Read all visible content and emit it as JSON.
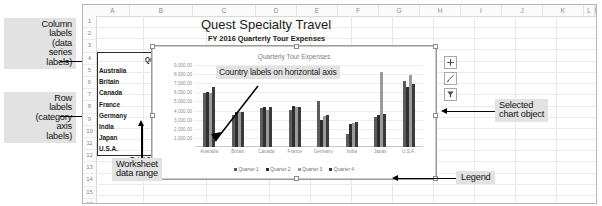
{
  "annotations": {
    "column_labels": [
      "Column",
      "labels",
      "(data",
      "series",
      "labels)"
    ],
    "row_labels": [
      "Row",
      "labels",
      "(category",
      "axis",
      "labels)"
    ],
    "worksheet_data_range": [
      "Worksheet",
      "data range"
    ],
    "selected_chart_object": [
      "Selected",
      "chart object"
    ],
    "legend_callout": "Legend",
    "country_labels": [
      "Country labels on",
      "horizontal axis"
    ]
  },
  "worksheet": {
    "column_headers": [
      "A",
      "B",
      "C",
      "D",
      "E",
      "F",
      "G",
      "H",
      "I",
      "J",
      "K",
      "L",
      "M"
    ],
    "row_headers": [
      "1",
      "2",
      "3",
      "4",
      "5",
      "6",
      "7",
      "8",
      "9",
      "10",
      "11",
      "12",
      "13",
      "14",
      "15",
      "16",
      "17",
      "18"
    ],
    "title": "Quest Specialty Travel",
    "subtitle": "FY 2016 Quarterly Tour Expenses",
    "headers": [
      "",
      "Quarter 1",
      "Quarter 2",
      "Qua"
    ],
    "rows": [
      {
        "country": "Australia",
        "q1": "5,976.20",
        "q2": "6,073.82"
      },
      {
        "country": "Britain",
        "q1": "3,510.99",
        "q2": "3,821.46"
      },
      {
        "country": "Canada",
        "q1": "4,287.76",
        "q2": "4,371.98"
      },
      {
        "country": "France",
        "q1": "4,032.10",
        "q2": "4,489.74"
      },
      {
        "country": "Germany",
        "q1": "5,082.77",
        "q2": "2,994.56"
      },
      {
        "country": "India",
        "q1": "1,468.25",
        "q2": "2,510.30"
      },
      {
        "country": "Japan",
        "q1": "3,271.50",
        "q2": "3,556.14"
      },
      {
        "country": "U.S.A.",
        "q1": "7,195.06",
        "q2": "6,542.76"
      }
    ],
    "total": {
      "label": "Total",
      "currency": "$",
      "q1": "34,824.63",
      "q2": "34,460.76",
      "q3_partial": "$"
    }
  },
  "chart_buttons": [
    {
      "name": "chart-elements-button",
      "icon": "plus-icon"
    },
    {
      "name": "chart-styles-button",
      "icon": "brush-icon"
    },
    {
      "name": "chart-filters-button",
      "icon": "funnel-icon"
    }
  ],
  "chart_data": {
    "type": "bar",
    "title": "Quarterly Tour Expenses",
    "xlabel": "",
    "ylabel": "",
    "ylim": [
      0,
      9000
    ],
    "grid": true,
    "legend_position": "bottom",
    "ytick_labels": [
      "9,000.00",
      "8,000.00",
      "7,000.00",
      "6,000.00",
      "5,000.00",
      "4,000.00",
      "3,000.00",
      "2,000.00",
      "1,000.00"
    ],
    "yticks": [
      9000,
      8000,
      7000,
      6000,
      5000,
      4000,
      3000,
      2000,
      1000
    ],
    "categories": [
      "Australia",
      "Britain",
      "Canada",
      "France",
      "Germany",
      "India",
      "Japan",
      "U.S.A."
    ],
    "series": [
      {
        "name": "Quarter 1",
        "color": "#5c5c5c",
        "values": [
          5976.2,
          3510.99,
          4287.76,
          4032.1,
          5082.77,
          1468.25,
          3271.5,
          7195.06
        ]
      },
      {
        "name": "Quarter 2",
        "color": "#2e2e2e",
        "values": [
          6073.82,
          3821.46,
          4371.98,
          4489.74,
          2994.56,
          2510.3,
          3556.14,
          6542.76
        ]
      },
      {
        "name": "Quarter 3",
        "color": "#9a9a9a",
        "values": [
          5980.0,
          3790.0,
          4100.0,
          4350.0,
          3400.0,
          2670.0,
          8280.0,
          7950.0
        ]
      },
      {
        "name": "Quarter 4",
        "color": "#3a3a3a",
        "values": [
          6620.0,
          3860.0,
          4420.0,
          4390.0,
          3470.0,
          2780.0,
          3640.0,
          6950.0
        ]
      }
    ]
  }
}
